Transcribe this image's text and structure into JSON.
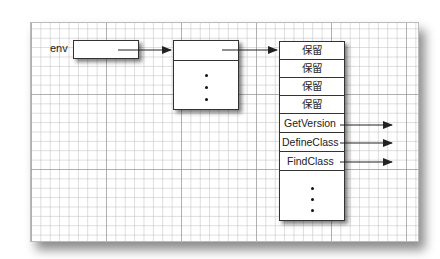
{
  "diagram": {
    "env_label": "env",
    "table_rows": [
      {
        "label": "保留",
        "arrow": false
      },
      {
        "label": "保留",
        "arrow": false
      },
      {
        "label": "保留",
        "arrow": false
      },
      {
        "label": "保留",
        "arrow": false
      },
      {
        "label": "GetVersion",
        "arrow": true
      },
      {
        "label": "DefineClass",
        "arrow": true
      },
      {
        "label": "FindClass",
        "arrow": true
      }
    ],
    "ellipsis": "⋮",
    "colors": {
      "stroke": "#333333",
      "grid_minor": "#c8c8c8",
      "grid_major": "#9a9a9a"
    }
  }
}
